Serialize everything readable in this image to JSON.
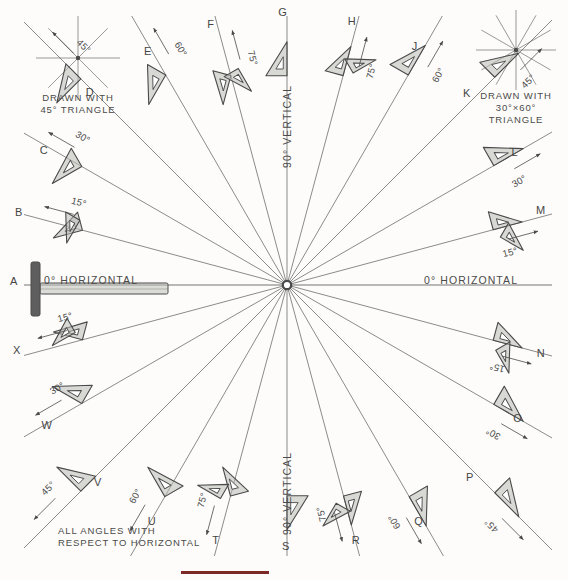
{
  "figure": {
    "title_bottom_left": "ALL ANGLES WITH\nRESPECT TO HORIZONTAL",
    "center": {
      "x": 287,
      "y": 285
    },
    "accent_color": "#7d2a26",
    "ink_color": "#4a4a4a",
    "triangle_fill": "#b9b9b4",
    "background": "#fdfcfa"
  },
  "legends": [
    {
      "name": "legend-45",
      "caption": "DRAWN WITH\n45° TRIANGLE",
      "rays": 8,
      "ray_step_deg": 45,
      "cx": 78,
      "cy": 58,
      "r": 42
    },
    {
      "name": "legend-3060",
      "caption": "DRAWN WITH\n30°×60°\nTRIANGLE",
      "rays": 12,
      "ray_step_deg": 30,
      "cx": 516,
      "cy": 50,
      "r": 40
    }
  ],
  "axis_labels": {
    "horizontal_left": "0° HORIZONTAL",
    "horizontal_right": "0° HORIZONTAL",
    "vertical_top": "90° VERTICAL",
    "vertical_bottom": "90° VERTICAL"
  },
  "rays": {
    "count": 24,
    "step_deg": 15,
    "start_deg": 0
  },
  "stations": [
    {
      "letter": "A",
      "angle": "0°",
      "angle_label": "",
      "deg": 180,
      "lx": 14,
      "ly": 281,
      "tool": "t-square"
    },
    {
      "letter": "B",
      "angle": "15°",
      "angle_label": "15°",
      "deg": 165,
      "lx": 19,
      "ly": 212,
      "tool": "triangle-pair"
    },
    {
      "letter": "C",
      "angle": "30°",
      "angle_label": "30°",
      "deg": 150,
      "lx": 44,
      "ly": 150,
      "tool": "triangle"
    },
    {
      "letter": "D",
      "angle": "45°",
      "angle_label": "45°",
      "deg": 135,
      "lx": 90,
      "ly": 92,
      "tool": "triangle"
    },
    {
      "letter": "E",
      "angle": "60°",
      "angle_label": "60°",
      "deg": 120,
      "lx": 148,
      "ly": 51,
      "tool": "triangle"
    },
    {
      "letter": "F",
      "angle": "75°",
      "angle_label": "75°",
      "deg": 105,
      "lx": 211,
      "ly": 24,
      "tool": "triangle-pair"
    },
    {
      "letter": "G",
      "angle": "90°",
      "angle_label": "",
      "deg": 90,
      "lx": 283,
      "ly": 12,
      "tool": "triangle"
    },
    {
      "letter": "H",
      "angle": "75°",
      "angle_label": "75°",
      "deg": 75,
      "lx": 352,
      "ly": 21,
      "tool": "triangle-pair"
    },
    {
      "letter": "J",
      "angle": "60°",
      "angle_label": "60°",
      "deg": 60,
      "lx": 415,
      "ly": 46,
      "tool": "triangle"
    },
    {
      "letter": "K",
      "angle": "45°",
      "angle_label": "45°",
      "deg": 45,
      "lx": 467,
      "ly": 93,
      "tool": "triangle"
    },
    {
      "letter": "L",
      "angle": "30°",
      "angle_label": "30°",
      "deg": 30,
      "lx": 515,
      "ly": 152,
      "tool": "triangle"
    },
    {
      "letter": "M",
      "angle": "15°",
      "angle_label": "15°",
      "deg": 15,
      "lx": 541,
      "ly": 210,
      "tool": "triangle-pair"
    },
    {
      "letter": "N",
      "angle": "15°",
      "angle_label": "15°",
      "deg": 345,
      "lx": 541,
      "ly": 353,
      "tool": "triangle-pair"
    },
    {
      "letter": "O",
      "angle": "30°",
      "angle_label": "30°",
      "deg": 330,
      "lx": 518,
      "ly": 418,
      "tool": "triangle"
    },
    {
      "letter": "P",
      "angle": "45°",
      "angle_label": "45°",
      "deg": 315,
      "lx": 470,
      "ly": 477,
      "tool": "triangle"
    },
    {
      "letter": "Q",
      "angle": "60°",
      "angle_label": "60°",
      "deg": 300,
      "lx": 419,
      "ly": 521,
      "tool": "triangle"
    },
    {
      "letter": "R",
      "angle": "75°",
      "angle_label": "75°",
      "deg": 285,
      "lx": 356,
      "ly": 540,
      "tool": "triangle-pair"
    },
    {
      "letter": "S",
      "angle": "90°",
      "angle_label": "",
      "deg": 270,
      "lx": 286,
      "ly": 546,
      "tool": "triangle"
    },
    {
      "letter": "T",
      "angle": "75°",
      "angle_label": "75°",
      "deg": 255,
      "lx": 216,
      "ly": 540,
      "tool": "triangle-pair"
    },
    {
      "letter": "U",
      "angle": "60°",
      "angle_label": "60°",
      "deg": 240,
      "lx": 152,
      "ly": 521,
      "tool": "triangle"
    },
    {
      "letter": "V",
      "angle": "45°",
      "angle_label": "45°",
      "deg": 225,
      "lx": 98,
      "ly": 482,
      "tool": "triangle"
    },
    {
      "letter": "W",
      "angle": "30°",
      "angle_label": "30°",
      "deg": 210,
      "lx": 47,
      "ly": 425,
      "tool": "triangle"
    },
    {
      "letter": "X",
      "angle": "15°",
      "angle_label": "15°",
      "deg": 195,
      "lx": 17,
      "ly": 350,
      "tool": "triangle-pair"
    }
  ]
}
